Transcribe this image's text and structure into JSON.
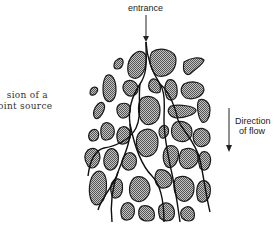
{
  "caption": {
    "line1": "sion of a",
    "line2": "oint source"
  },
  "labels": {
    "entrance": "entrance",
    "flow_line1": "Direction",
    "flow_line2": "of flow"
  },
  "colors": {
    "grain_fill": "#9a9a9a",
    "grain_stroke": "#1a1a1a",
    "stream": "#111111",
    "text": "#222222"
  },
  "icons": {
    "entrance_arrow": "arrow-down-icon",
    "flow_arrow": "arrow-down-icon"
  }
}
